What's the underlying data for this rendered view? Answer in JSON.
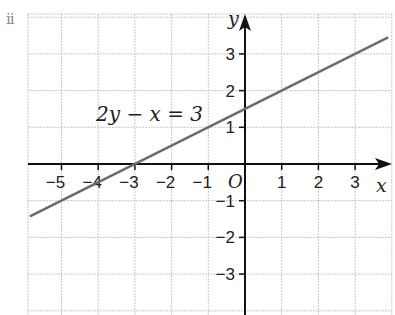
{
  "part_label": "ii",
  "chart_data": {
    "type": "line",
    "title": "",
    "xlabel": "x",
    "ylabel": "y",
    "origin_label": "O",
    "xlim": [
      -5.9,
      3.9
    ],
    "ylim": [
      -4,
      4
    ],
    "x_ticks": [
      -5,
      -4,
      -3,
      -2,
      -1,
      1,
      2,
      3
    ],
    "y_ticks": [
      -3,
      -2,
      -1,
      1,
      2,
      3
    ],
    "x_tick_labels": [
      "−5",
      "−4",
      "−3",
      "−2",
      "−1",
      "1",
      "2",
      "3"
    ],
    "y_tick_labels": [
      "−3",
      "−2",
      "−1",
      "1",
      "2",
      "3"
    ],
    "grid": true,
    "series": [
      {
        "name": "2y − x = 3",
        "equation": "2y − x = 3",
        "color": "#6b6b6b",
        "x": [
          -5.86,
          -3,
          0,
          1,
          3,
          3.9
        ],
        "y": [
          -1.43,
          0,
          1.5,
          2,
          3,
          3.45
        ]
      }
    ],
    "annotations": [
      {
        "text": "2y − x = 3",
        "x": -4.2,
        "y": 1.3
      }
    ]
  }
}
